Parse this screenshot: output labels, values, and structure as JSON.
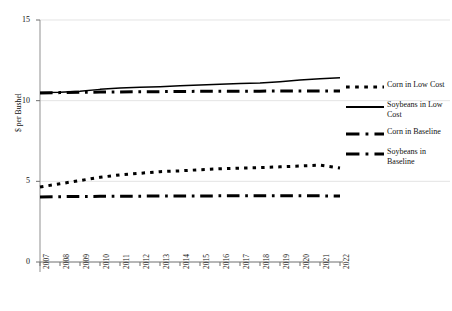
{
  "chart_data": {
    "type": "line",
    "title": "",
    "xlabel": "",
    "ylabel": "$ per Bushel",
    "categories": [
      "2007",
      "2008",
      "2009",
      "2010",
      "2011",
      "2012",
      "2013",
      "2014",
      "2015",
      "2016",
      "2017",
      "2018",
      "2019",
      "2020",
      "2021",
      "2022"
    ],
    "ylim": [
      0,
      15
    ],
    "y_ticks": [
      0,
      5,
      10,
      15
    ],
    "grid": true,
    "legend_position": "right",
    "series": [
      {
        "name": "Corn in Low Cost",
        "style": "dotted",
        "color": "#000000",
        "values": [
          4.65,
          4.85,
          5.05,
          5.25,
          5.4,
          5.5,
          5.6,
          5.65,
          5.72,
          5.78,
          5.82,
          5.85,
          5.9,
          5.95,
          6.0,
          5.83
        ]
      },
      {
        "name": "Soybeans in Low Cost",
        "style": "solid",
        "color": "#000000",
        "values": [
          10.5,
          10.52,
          10.58,
          10.7,
          10.78,
          10.83,
          10.87,
          10.92,
          10.97,
          11.02,
          11.06,
          11.1,
          11.18,
          11.28,
          11.36,
          11.42
        ]
      },
      {
        "name": "Corn in Baseline",
        "style": "dash-dot",
        "color": "#000000",
        "values": [
          4.03,
          4.05,
          4.06,
          4.07,
          4.08,
          4.08,
          4.09,
          4.09,
          4.09,
          4.1,
          4.1,
          4.1,
          4.1,
          4.1,
          4.1,
          4.09
        ]
      },
      {
        "name": "Soybeans in Baseline",
        "style": "dash-dot",
        "color": "#000000",
        "values": [
          10.48,
          10.5,
          10.52,
          10.53,
          10.54,
          10.55,
          10.56,
          10.57,
          10.58,
          10.58,
          10.59,
          10.59,
          10.6,
          10.6,
          10.6,
          10.6
        ]
      }
    ]
  },
  "legend": {
    "items": [
      {
        "label": "Corn in Low Cost"
      },
      {
        "label": "Soybeans in Low Cost"
      },
      {
        "label": "Corn in Baseline"
      },
      {
        "label": "Soybeans in Baseline"
      }
    ]
  },
  "axes": {
    "y_title": "$ per Bushel"
  }
}
